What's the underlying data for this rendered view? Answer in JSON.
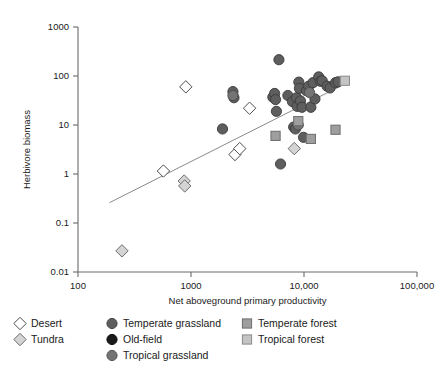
{
  "chart_data": {
    "type": "scatter",
    "title": "",
    "xlabel": "Net aboveground primary productivity",
    "ylabel": "Herbivore biomass",
    "xscale": "log",
    "yscale": "log",
    "xlim": [
      100,
      100000
    ],
    "ylim": [
      0.01,
      1000
    ],
    "xticks": [
      100,
      1000,
      10000,
      100000
    ],
    "xtick_labels": [
      "100",
      "1000",
      "10,000",
      "100,000"
    ],
    "yticks": [
      0.01,
      0.1,
      1,
      10,
      100,
      1000
    ],
    "ytick_labels": [
      "0.01",
      "0.1",
      "1",
      "10",
      "100",
      "1000"
    ],
    "grid": false,
    "legend_position": "below-axes",
    "trendline": {
      "type": "linear-log-log",
      "x_start": 190,
      "y_start": 0.26,
      "x_end": 21000,
      "y_end": 62
    },
    "series": [
      {
        "name": "Desert",
        "marker": "diamond",
        "fill": "#ffffff",
        "edge": "#4d4d4d",
        "points": [
          {
            "x": 570,
            "y": 1.15
          },
          {
            "x": 900,
            "y": 60
          },
          {
            "x": 2450,
            "y": 2.5
          },
          {
            "x": 2700,
            "y": 3.3
          },
          {
            "x": 3300,
            "y": 22
          }
        ]
      },
      {
        "name": "Tundra",
        "marker": "diamond",
        "fill": "#d4d4d4",
        "edge": "#6e6e6e",
        "points": [
          {
            "x": 245,
            "y": 0.027
          },
          {
            "x": 870,
            "y": 0.72
          },
          {
            "x": 880,
            "y": 0.57
          },
          {
            "x": 8200,
            "y": 3.3
          }
        ]
      },
      {
        "name": "Temperate grassland",
        "marker": "circle",
        "fill": "#5e5e5e",
        "edge": "#3a3a3a",
        "points": [
          {
            "x": 1900,
            "y": 8.3
          },
          {
            "x": 2350,
            "y": 48
          },
          {
            "x": 2400,
            "y": 36
          },
          {
            "x": 5300,
            "y": 37
          },
          {
            "x": 5500,
            "y": 44
          },
          {
            "x": 5600,
            "y": 33
          },
          {
            "x": 5700,
            "y": 19
          },
          {
            "x": 6000,
            "y": 215
          },
          {
            "x": 6200,
            "y": 1.6
          },
          {
            "x": 7200,
            "y": 40
          },
          {
            "x": 7900,
            "y": 30
          },
          {
            "x": 8100,
            "y": 9.1
          },
          {
            "x": 8400,
            "y": 8.3
          },
          {
            "x": 8600,
            "y": 36
          },
          {
            "x": 8700,
            "y": 24
          },
          {
            "x": 9000,
            "y": 75
          },
          {
            "x": 9100,
            "y": 56
          },
          {
            "x": 9300,
            "y": 31
          },
          {
            "x": 9600,
            "y": 23
          },
          {
            "x": 9900,
            "y": 5.6
          },
          {
            "x": 10500,
            "y": 50
          },
          {
            "x": 11000,
            "y": 62
          },
          {
            "x": 11500,
            "y": 23
          },
          {
            "x": 12000,
            "y": 73
          },
          {
            "x": 12500,
            "y": 34
          },
          {
            "x": 13500,
            "y": 96
          },
          {
            "x": 14000,
            "y": 78
          },
          {
            "x": 14500,
            "y": 80
          },
          {
            "x": 16000,
            "y": 62
          },
          {
            "x": 17000,
            "y": 57
          },
          {
            "x": 19000,
            "y": 73
          },
          {
            "x": 20000,
            "y": 76
          }
        ]
      },
      {
        "name": "Old-field",
        "marker": "circle",
        "fill": "#1a1a1a",
        "edge": "#000000",
        "points": []
      },
      {
        "name": "Tropical grassland",
        "marker": "circle",
        "fill": "#747474",
        "edge": "#4a4a4a",
        "points": [
          {
            "x": 2350,
            "y": 40
          },
          {
            "x": 8900,
            "y": 10
          },
          {
            "x": 11200,
            "y": 46
          }
        ]
      },
      {
        "name": "Temperate forest",
        "marker": "square",
        "fill": "#9e9e9e",
        "edge": "#6e6e6e",
        "points": [
          {
            "x": 5600,
            "y": 6.0
          },
          {
            "x": 8900,
            "y": 12
          },
          {
            "x": 11500,
            "y": 5.2
          },
          {
            "x": 19000,
            "y": 8.0
          }
        ]
      },
      {
        "name": "Tropical forest",
        "marker": "square",
        "fill": "#c4c4c4",
        "edge": "#8a8a8a",
        "points": [
          {
            "x": 23000,
            "y": 80
          }
        ]
      }
    ]
  },
  "axes": {
    "xlabel": "Net aboveground primary productivity",
    "ylabel": "Herbivore biomass",
    "xtick_labels": [
      "100",
      "1000",
      "10,000",
      "100,000"
    ],
    "ytick_labels": [
      "1000",
      "100",
      "10",
      "1",
      "0.1",
      "0.01"
    ]
  },
  "legend": {
    "columns": [
      {
        "entries": [
          {
            "label": "Desert",
            "marker": "diamond",
            "fill": "#ffffff",
            "edge": "#4d4d4d"
          },
          {
            "label": "Tundra",
            "marker": "diamond",
            "fill": "#d4d4d4",
            "edge": "#6e6e6e"
          }
        ]
      },
      {
        "entries": [
          {
            "label": "Temperate grassland",
            "marker": "circle",
            "fill": "#5e5e5e",
            "edge": "#3a3a3a"
          },
          {
            "label": "Old-field",
            "marker": "circle",
            "fill": "#1a1a1a",
            "edge": "#000000"
          },
          {
            "label": "Tropical grassland",
            "marker": "circle",
            "fill": "#747474",
            "edge": "#4a4a4a"
          }
        ]
      },
      {
        "entries": [
          {
            "label": "Temperate forest",
            "marker": "square",
            "fill": "#9e9e9e",
            "edge": "#6e6e6e"
          },
          {
            "label": "Tropical forest",
            "marker": "square",
            "fill": "#c4c4c4",
            "edge": "#8a8a8a"
          }
        ]
      }
    ]
  },
  "colors": {
    "axis": "#6b6b6b",
    "text": "#1a1a1a",
    "trendline": "#8a8a8a",
    "background": "#ffffff"
  }
}
